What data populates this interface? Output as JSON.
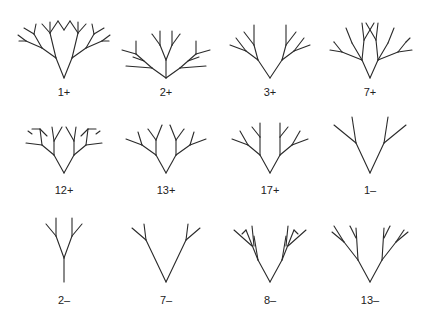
{
  "figure": {
    "stroke_color": "#2a2a2a",
    "background": "#ffffff",
    "trees": [
      {
        "label": "1+",
        "root": [
          64,
          78
        ],
        "label_pos": [
          64,
          92
        ],
        "segments": [
          [
            0,
            0,
            -8,
            -20
          ],
          [
            0,
            0,
            8,
            -20
          ],
          [
            -8,
            -20,
            -14,
            -45
          ],
          [
            8,
            -20,
            14,
            -45
          ],
          [
            -8,
            -20,
            -22,
            -30
          ],
          [
            8,
            -20,
            22,
            -30
          ],
          [
            -22,
            -30,
            -38,
            -37
          ],
          [
            22,
            -30,
            38,
            -37
          ],
          [
            -22,
            -30,
            -30,
            -44
          ],
          [
            22,
            -30,
            30,
            -44
          ],
          [
            -30,
            -44,
            -40,
            -50
          ],
          [
            30,
            -44,
            40,
            -50
          ],
          [
            -30,
            -44,
            -28,
            -54
          ],
          [
            30,
            -44,
            28,
            -54
          ],
          [
            -38,
            -37,
            -46,
            -43
          ],
          [
            38,
            -37,
            46,
            -43
          ],
          [
            -38,
            -37,
            -45,
            -37
          ],
          [
            38,
            -37,
            45,
            -37
          ],
          [
            -14,
            -45,
            -22,
            -54
          ],
          [
            14,
            -45,
            22,
            -54
          ],
          [
            -14,
            -45,
            -14,
            -56
          ],
          [
            14,
            -45,
            14,
            -56
          ],
          [
            -14,
            -45,
            -6,
            -57
          ],
          [
            14,
            -45,
            6,
            -57
          ],
          [
            -6,
            -57,
            0,
            -48
          ],
          [
            6,
            -57,
            0,
            -48
          ]
        ]
      },
      {
        "label": "2+",
        "root": [
          166,
          78
        ],
        "label_pos": [
          166,
          92
        ],
        "segments": [
          [
            0,
            0,
            0,
            -18
          ],
          [
            0,
            0,
            -14,
            -10
          ],
          [
            0,
            0,
            14,
            -10
          ],
          [
            0,
            -18,
            -6,
            -33
          ],
          [
            0,
            -18,
            6,
            -33
          ],
          [
            -6,
            -33,
            -14,
            -44
          ],
          [
            6,
            -33,
            14,
            -44
          ],
          [
            -6,
            -33,
            -6,
            -47
          ],
          [
            6,
            -33,
            6,
            -47
          ],
          [
            -14,
            -10,
            -40,
            -12
          ],
          [
            14,
            -10,
            40,
            -12
          ],
          [
            -14,
            -10,
            -30,
            -24
          ],
          [
            14,
            -10,
            30,
            -24
          ],
          [
            -30,
            -24,
            -44,
            -28
          ],
          [
            30,
            -24,
            44,
            -28
          ],
          [
            -30,
            -24,
            -30,
            -37
          ],
          [
            30,
            -24,
            30,
            -37
          ],
          [
            -22,
            -17,
            -33,
            -21
          ],
          [
            22,
            -17,
            33,
            -21
          ]
        ]
      },
      {
        "label": "3+",
        "root": [
          270,
          78
        ],
        "label_pos": [
          270,
          92
        ],
        "segments": [
          [
            0,
            0,
            -12,
            -18
          ],
          [
            0,
            0,
            12,
            -18
          ],
          [
            -12,
            -18,
            -16,
            -33
          ],
          [
            12,
            -18,
            16,
            -33
          ],
          [
            -16,
            -33,
            -16,
            -53
          ],
          [
            16,
            -33,
            16,
            -53
          ],
          [
            -16,
            -33,
            -26,
            -46
          ],
          [
            16,
            -33,
            26,
            -46
          ],
          [
            -12,
            -18,
            -24,
            -27
          ],
          [
            12,
            -18,
            24,
            -27
          ],
          [
            -24,
            -27,
            -40,
            -33
          ],
          [
            24,
            -27,
            40,
            -33
          ],
          [
            -24,
            -27,
            -34,
            -40
          ],
          [
            24,
            -27,
            34,
            -40
          ]
        ]
      },
      {
        "label": "7+",
        "root": [
          370,
          78
        ],
        "label_pos": [
          370,
          92
        ],
        "segments": [
          [
            0,
            0,
            -8,
            -18
          ],
          [
            0,
            0,
            8,
            -18
          ],
          [
            -8,
            -18,
            -6,
            -38
          ],
          [
            8,
            -18,
            6,
            -38
          ],
          [
            -6,
            -38,
            4,
            -55
          ],
          [
            6,
            -38,
            -4,
            -55
          ],
          [
            -6,
            -38,
            -8,
            -55
          ],
          [
            6,
            -38,
            8,
            -55
          ],
          [
            -8,
            -18,
            -18,
            -35
          ],
          [
            8,
            -18,
            18,
            -35
          ],
          [
            -18,
            -35,
            -24,
            -50
          ],
          [
            18,
            -35,
            24,
            -50
          ],
          [
            -8,
            -18,
            -28,
            -26
          ],
          [
            8,
            -18,
            28,
            -26
          ],
          [
            -28,
            -26,
            -40,
            -28
          ],
          [
            28,
            -26,
            42,
            -28
          ],
          [
            -28,
            -26,
            -36,
            -36
          ],
          [
            28,
            -26,
            36,
            -36
          ],
          [
            -36,
            -36,
            -36,
            -36
          ],
          [
            36,
            -36,
            40,
            -40
          ]
        ]
      },
      {
        "label": "12+",
        "root": [
          64,
          173
        ],
        "label_pos": [
          64,
          190
        ],
        "segments": [
          [
            0,
            0,
            -10,
            -18
          ],
          [
            0,
            0,
            10,
            -18
          ],
          [
            -10,
            -18,
            -10,
            -32
          ],
          [
            10,
            -18,
            10,
            -32
          ],
          [
            -10,
            -32,
            -12,
            -46
          ],
          [
            10,
            -32,
            12,
            -46
          ],
          [
            -10,
            -32,
            -2,
            -46
          ],
          [
            10,
            -32,
            2,
            -46
          ],
          [
            -10,
            -18,
            -22,
            -28
          ],
          [
            10,
            -18,
            22,
            -28
          ],
          [
            -22,
            -28,
            -38,
            -30
          ],
          [
            22,
            -28,
            38,
            -30
          ],
          [
            -22,
            -28,
            -24,
            -44
          ],
          [
            22,
            -28,
            24,
            -44
          ],
          [
            -24,
            -44,
            -17,
            -37
          ],
          [
            24,
            -44,
            17,
            -37
          ],
          [
            -24,
            -44,
            -32,
            -44
          ],
          [
            24,
            -44,
            32,
            -44
          ],
          [
            -32,
            -39,
            -36,
            -42
          ],
          [
            32,
            -39,
            36,
            -42
          ]
        ]
      },
      {
        "label": "13+",
        "root": [
          166,
          173
        ],
        "label_pos": [
          166,
          190
        ],
        "segments": [
          [
            0,
            0,
            -10,
            -18
          ],
          [
            0,
            0,
            10,
            -18
          ],
          [
            -10,
            -18,
            -10,
            -33
          ],
          [
            10,
            -18,
            10,
            -33
          ],
          [
            -10,
            -33,
            -18,
            -44
          ],
          [
            10,
            -33,
            18,
            -44
          ],
          [
            -10,
            -33,
            -4,
            -48
          ],
          [
            10,
            -33,
            4,
            -48
          ],
          [
            -10,
            -18,
            -24,
            -28
          ],
          [
            10,
            -18,
            24,
            -28
          ],
          [
            -24,
            -28,
            -40,
            -34
          ],
          [
            24,
            -28,
            40,
            -34
          ],
          [
            -24,
            -28,
            -28,
            -41
          ],
          [
            24,
            -28,
            28,
            -41
          ]
        ]
      },
      {
        "label": "17+",
        "root": [
          270,
          173
        ],
        "label_pos": [
          270,
          190
        ],
        "segments": [
          [
            0,
            0,
            -10,
            -18
          ],
          [
            0,
            0,
            10,
            -18
          ],
          [
            -10,
            -18,
            -10,
            -36
          ],
          [
            10,
            -18,
            10,
            -36
          ],
          [
            -10,
            -36,
            -10,
            -50
          ],
          [
            10,
            -36,
            10,
            -50
          ],
          [
            -10,
            -36,
            -18,
            -46
          ],
          [
            10,
            -36,
            18,
            -46
          ],
          [
            -10,
            -18,
            -22,
            -28
          ],
          [
            10,
            -18,
            22,
            -28
          ],
          [
            -22,
            -28,
            -38,
            -34
          ],
          [
            22,
            -28,
            38,
            -34
          ],
          [
            -22,
            -28,
            -30,
            -42
          ],
          [
            22,
            -28,
            30,
            -42
          ]
        ]
      },
      {
        "label": "1–",
        "root": [
          370,
          173
        ],
        "label_pos": [
          370,
          190
        ],
        "segments": [
          [
            0,
            0,
            -14,
            -30
          ],
          [
            0,
            0,
            14,
            -30
          ],
          [
            -14,
            -30,
            -18,
            -56
          ],
          [
            14,
            -30,
            18,
            -56
          ],
          [
            -14,
            -30,
            -36,
            -48
          ],
          [
            14,
            -30,
            36,
            -48
          ]
        ]
      },
      {
        "label": "2–",
        "root": [
          64,
          282
        ],
        "label_pos": [
          64,
          300
        ],
        "segments": [
          [
            0,
            0,
            0,
            -24
          ],
          [
            0,
            -24,
            -8,
            -46
          ],
          [
            0,
            -24,
            8,
            -46
          ],
          [
            -8,
            -46,
            -8,
            -64
          ],
          [
            8,
            -46,
            8,
            -64
          ],
          [
            -8,
            -46,
            -18,
            -58
          ],
          [
            8,
            -46,
            18,
            -58
          ]
        ]
      },
      {
        "label": "7–",
        "root": [
          166,
          282
        ],
        "label_pos": [
          166,
          300
        ],
        "segments": [
          [
            0,
            0,
            -20,
            -42
          ],
          [
            0,
            0,
            20,
            -42
          ],
          [
            -20,
            -42,
            -22,
            -58
          ],
          [
            20,
            -42,
            22,
            -58
          ],
          [
            -20,
            -42,
            -34,
            -54
          ],
          [
            20,
            -42,
            34,
            -54
          ]
        ]
      },
      {
        "label": "8–",
        "root": [
          270,
          282
        ],
        "label_pos": [
          270,
          300
        ],
        "segments": [
          [
            0,
            0,
            -12,
            -22
          ],
          [
            0,
            0,
            12,
            -22
          ],
          [
            -12,
            -22,
            -16,
            -46
          ],
          [
            12,
            -22,
            16,
            -46
          ],
          [
            -12,
            -22,
            -24,
            -52
          ],
          [
            12,
            -22,
            24,
            -52
          ],
          [
            -24,
            -52,
            -28,
            -48
          ],
          [
            24,
            -52,
            28,
            -48
          ],
          [
            -18,
            -36,
            -36,
            -52
          ],
          [
            18,
            -36,
            36,
            -52
          ],
          [
            -16,
            -36,
            -18,
            -56
          ],
          [
            16,
            -36,
            18,
            -56
          ]
        ]
      },
      {
        "label": "13–",
        "root": [
          370,
          282
        ],
        "label_pos": [
          370,
          300
        ],
        "segments": [
          [
            0,
            0,
            -12,
            -22
          ],
          [
            0,
            0,
            12,
            -22
          ],
          [
            -12,
            -22,
            -14,
            -54
          ],
          [
            12,
            -22,
            14,
            -54
          ],
          [
            -14,
            -44,
            -20,
            -56
          ],
          [
            14,
            -44,
            20,
            -56
          ],
          [
            -12,
            -22,
            -26,
            -40
          ],
          [
            12,
            -22,
            26,
            -40
          ],
          [
            -26,
            -40,
            -38,
            -50
          ],
          [
            26,
            -40,
            38,
            -50
          ],
          [
            -26,
            -40,
            -36,
            -56
          ],
          [
            26,
            -40,
            34,
            -52
          ]
        ]
      }
    ]
  }
}
